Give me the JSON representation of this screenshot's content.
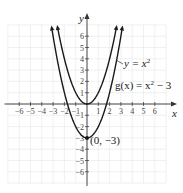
{
  "chart_data": {
    "type": "line",
    "title": "",
    "xlabel": "x",
    "ylabel": "y",
    "xlim": [
      -7,
      7
    ],
    "ylim": [
      -7,
      7
    ],
    "grid": true,
    "x_ticks": [
      -6,
      -5,
      -4,
      -3,
      -2,
      -1,
      1,
      2,
      3,
      4,
      5,
      6
    ],
    "y_ticks": [
      -6,
      -5,
      -4,
      -3,
      -2,
      -1,
      1,
      2,
      3,
      4,
      5,
      6
    ],
    "x_tick_labels": [
      "−6",
      "−5",
      "−4",
      "−3",
      "−2",
      "−1",
      "1",
      "2",
      "3",
      "4",
      "5",
      "6"
    ],
    "y_tick_labels": [
      "−6",
      "−5",
      "−4",
      "−3",
      "−2",
      "−1",
      "1",
      "2",
      "3",
      "4",
      "5",
      "6"
    ],
    "series": [
      {
        "name": "y = x²",
        "formula": "x^2",
        "x": [
          -2.65,
          -2,
          -1,
          0,
          1,
          2,
          2.65
        ],
        "y": [
          7,
          4,
          1,
          0,
          1,
          4,
          7
        ]
      },
      {
        "name": "g(x) = x² − 3",
        "formula": "x^2 - 3",
        "x": [
          -3.16,
          -3,
          -2,
          -1,
          0,
          1,
          2,
          3,
          3.16
        ],
        "y": [
          7,
          6,
          1,
          -2,
          -3,
          -2,
          1,
          6,
          7
        ]
      }
    ],
    "annotations": [
      {
        "text": "(0, −3)",
        "x": 0,
        "y": -3,
        "marker": "point"
      },
      {
        "text": "y = x²",
        "target_series": 0
      },
      {
        "text": "g(x) = x² − 3",
        "target_series": 1
      }
    ]
  },
  "labels": {
    "x_axis": "x",
    "y_axis": "y",
    "curve1": "y = x",
    "curve1_exp": "2",
    "curve2_prefix": "g(x) = x",
    "curve2_exp": "2",
    "curve2_suffix": " − 3",
    "vertex": "(0, −3)"
  },
  "colors": {
    "curve": "#1a1a1a",
    "axis": "#333333",
    "grid": "#e6e6e6"
  }
}
